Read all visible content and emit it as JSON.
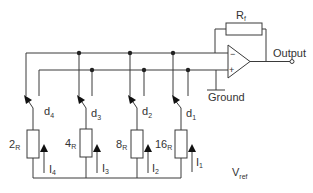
{
  "diagram": {
    "type": "R-2R weighted resistor DAC circuit",
    "feedback_resistor": {
      "label": "R",
      "subscript": "f"
    },
    "output_label": "Output",
    "ground_label": "Ground",
    "vref": {
      "label": "V",
      "subscript": "ref"
    },
    "op_amp": {
      "inverting": "−",
      "non_inverting": "+"
    },
    "branches": [
      {
        "switch": {
          "label": "d",
          "subscript": "4"
        },
        "resistor": {
          "label": "2",
          "subscript": "R"
        },
        "current": {
          "label": "I",
          "subscript": "4"
        }
      },
      {
        "switch": {
          "label": "d",
          "subscript": "3"
        },
        "resistor": {
          "label": "4",
          "subscript": "R"
        },
        "current": {
          "label": "I",
          "subscript": "3"
        }
      },
      {
        "switch": {
          "label": "d",
          "subscript": "2"
        },
        "resistor": {
          "label": "8",
          "subscript": "R"
        },
        "current": {
          "label": "I",
          "subscript": "2"
        }
      },
      {
        "switch": {
          "label": "d",
          "subscript": "1"
        },
        "resistor": {
          "label": "16",
          "subscript": "R"
        },
        "current": {
          "label": "I",
          "subscript": "1"
        }
      }
    ]
  },
  "colors": {
    "wire": "#3a3a3a",
    "text": "#333333",
    "background": "#ffffff"
  }
}
